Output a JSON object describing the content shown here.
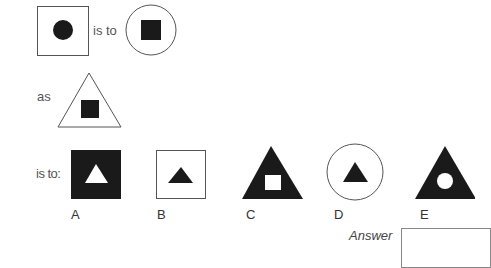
{
  "question": {
    "connector_is_to": "is to",
    "connector_as": "as",
    "connector_is_to_colon": "is to:",
    "premise_shapes": {
      "first": {
        "outer": "square-outline",
        "inner": "filled-circle"
      },
      "second": {
        "outer": "circle-outline",
        "inner": "filled-square"
      },
      "third": {
        "outer": "triangle-outline",
        "inner": "filled-square"
      }
    }
  },
  "options": [
    {
      "letter": "A",
      "outer": "filled-square",
      "inner": "white-triangle"
    },
    {
      "letter": "B",
      "outer": "square-outline",
      "inner": "filled-triangle"
    },
    {
      "letter": "C",
      "outer": "filled-triangle",
      "inner": "white-square"
    },
    {
      "letter": "D",
      "outer": "circle-outline",
      "inner": "filled-triangle"
    },
    {
      "letter": "E",
      "outer": "filled-triangle",
      "inner": "white-circle"
    }
  ],
  "answer": {
    "label": "Answer",
    "value": ""
  },
  "colors": {
    "fill": "#1a1a1a",
    "outline": "#555555",
    "background": "#ffffff"
  }
}
